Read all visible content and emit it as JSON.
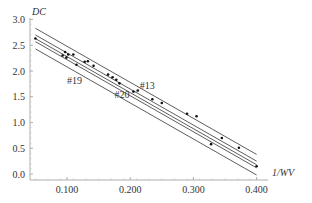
{
  "chart_data": {
    "type": "scatter",
    "title": "",
    "xlabel": "1/WV",
    "ylabel": "DC",
    "xlim": [
      0.04,
      0.41
    ],
    "ylim": [
      -0.05,
      3.0
    ],
    "grid": false,
    "x_ticks": [
      "0.100",
      "0.200",
      "0.300",
      "0.400"
    ],
    "y_ticks": [
      "0.0",
      "0.5",
      "1.0",
      "1.5",
      "2.0",
      "2.5",
      "3.0"
    ],
    "points": [
      {
        "x": 0.05,
        "y": 2.63
      },
      {
        "x": 0.093,
        "y": 2.3
      },
      {
        "x": 0.097,
        "y": 2.37
      },
      {
        "x": 0.099,
        "y": 2.26
      },
      {
        "x": 0.102,
        "y": 2.32
      },
      {
        "x": 0.11,
        "y": 2.32
      },
      {
        "x": 0.115,
        "y": 2.12
      },
      {
        "x": 0.128,
        "y": 2.18
      },
      {
        "x": 0.133,
        "y": 2.19
      },
      {
        "x": 0.142,
        "y": 2.1
      },
      {
        "x": 0.165,
        "y": 1.93
      },
      {
        "x": 0.172,
        "y": 1.88
      },
      {
        "x": 0.178,
        "y": 1.83
      },
      {
        "x": 0.183,
        "y": 1.76
      },
      {
        "x": 0.205,
        "y": 1.6
      },
      {
        "x": 0.212,
        "y": 1.62
      },
      {
        "x": 0.235,
        "y": 1.45
      },
      {
        "x": 0.25,
        "y": 1.38
      },
      {
        "x": 0.29,
        "y": 1.17
      },
      {
        "x": 0.305,
        "y": 1.12
      },
      {
        "x": 0.328,
        "y": 0.58
      },
      {
        "x": 0.345,
        "y": 0.7
      },
      {
        "x": 0.372,
        "y": 0.51
      },
      {
        "x": 0.4,
        "y": 0.15
      }
    ],
    "lines": [
      {
        "name": "upper",
        "x": [
          0.05,
          0.4
        ],
        "y": [
          2.83,
          0.38
        ]
      },
      {
        "name": "#13",
        "x": [
          0.05,
          0.4
        ],
        "y": [
          2.7,
          0.25
        ]
      },
      {
        "name": "fit",
        "x": [
          0.05,
          0.4
        ],
        "y": [
          2.63,
          0.18
        ]
      },
      {
        "name": "#19",
        "x": [
          0.05,
          0.4
        ],
        "y": [
          2.57,
          0.12
        ]
      },
      {
        "name": "#20",
        "x": [
          0.05,
          0.4
        ],
        "y": [
          2.43,
          -0.02
        ]
      }
    ],
    "annotations": [
      {
        "text": "#13",
        "x": 0.215,
        "y": 1.65
      },
      {
        "text": "#19",
        "x": 0.1,
        "y": 1.75
      },
      {
        "text": "#20",
        "x": 0.175,
        "y": 1.48
      }
    ]
  }
}
